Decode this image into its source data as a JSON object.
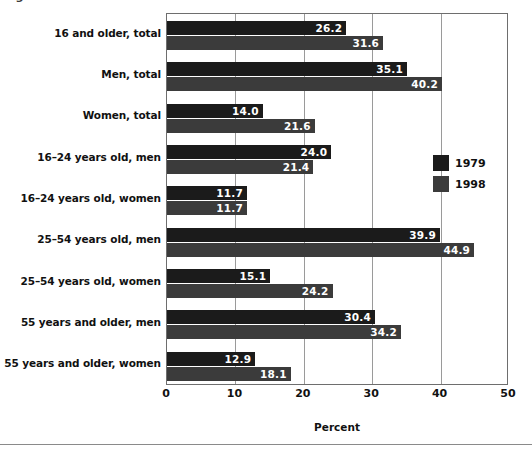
{
  "figure": {
    "title_partial": "Figure 2.  Percent of workers with flexible schedules",
    "xaxis_label": "Percent"
  },
  "legend": {
    "position": "right-middle",
    "items": [
      {
        "label": "1979",
        "color": "#1b1b1b"
      },
      {
        "label": "1998",
        "color": "#3b3b3b"
      }
    ]
  },
  "chart_data": {
    "type": "bar",
    "orientation": "horizontal",
    "title": "",
    "xlabel": "Percent",
    "ylabel": "",
    "xlim": [
      0,
      50
    ],
    "xticks": [
      0,
      10,
      20,
      30,
      40,
      50
    ],
    "grid": true,
    "legend_position": "right",
    "categories": [
      "16 and older, total",
      "Men, total",
      "Women, total",
      "16–24 years old, men",
      "16–24 years old, women",
      "25–54 years old, men",
      "25–54 years old, women",
      "55 years and older, men",
      "55 years and older, women"
    ],
    "series": [
      {
        "name": "1979",
        "color": "#1b1b1b",
        "values": [
          26.2,
          35.1,
          14.0,
          24.0,
          11.7,
          39.9,
          15.1,
          30.4,
          12.9
        ]
      },
      {
        "name": "1998",
        "color": "#3b3b3b",
        "values": [
          31.6,
          40.2,
          21.6,
          21.4,
          11.7,
          44.9,
          24.2,
          34.2,
          18.1
        ]
      }
    ]
  }
}
